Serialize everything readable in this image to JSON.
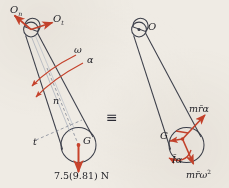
{
  "figure": {
    "equivalence_symbol": "≡",
    "colors": {
      "outline": "#3c3f4a",
      "vector_red": "#c8432c",
      "axis_gray": "#7a7f8c",
      "background": "#efebe4",
      "text": "#1c1c22"
    }
  },
  "free_body_diagram": {
    "name": "free-body-diagram",
    "pin_reaction_normal": "O",
    "pin_reaction_normal_sub": "n",
    "pin_reaction_tangential": "O",
    "pin_reaction_tangential_sub": "t",
    "angular_velocity": "ω",
    "angular_acceleration": "α",
    "normal_axis": "n",
    "tangential_axis": "t",
    "mass_center": "G",
    "weight_label": "7.5(9.81) N",
    "weight_value": 7.5,
    "gravity": 9.81,
    "weight_units": "N"
  },
  "kinetic_diagram": {
    "name": "kinetic-diagram",
    "pivot": "O",
    "mass_center": "G",
    "tangential_inertia_force": "mr̄α",
    "normal_inertia_force": "mr̄ω",
    "normal_inertia_force_exp": "2",
    "inertia_couple": "Īα"
  }
}
